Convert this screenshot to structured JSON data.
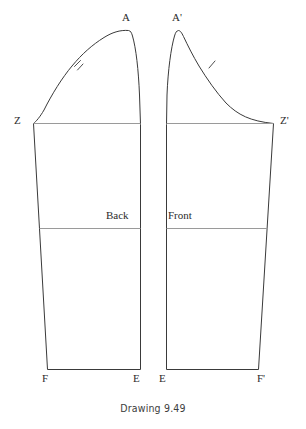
{
  "figure": {
    "caption": "Drawing 9.49",
    "background_color": "#ffffff",
    "outline_color": "#3a3a3a",
    "guide_line_color": "#9a9a9a",
    "text_color": "#2b2b2b",
    "width": 306,
    "height": 429
  },
  "pieces": [
    {
      "id": "back-sleeve",
      "name": "Back",
      "label": "Back",
      "label_x": 106,
      "label_y": 210,
      "outline_path": "M 128.5 30.5 C 120 29.8 112 32.5 104 37.5 C 92 45 82 54 72 66 C 62 78 52 94 44 110 C 40 117 36 121.5 33.5 123.5 L 47.5 369.5 L 140.5 369.5 L 140.5 124.5 L 139.5 95 C 138.5 70 136 48 132.5 36 C 131.5 32.5 130.5 30.8 128.5 30.5 Z",
      "guides": [
        {
          "name": "cap-line",
          "path": "M 33.5 123.5 L 140.5 123.5"
        },
        {
          "name": "elbow-line",
          "path": "M 39.5 228.5 L 140.5 228.5"
        }
      ],
      "notch": {
        "name": "double-notch",
        "path": "M 74.5 66.5 L 80.5 60.5 M 77.5 70.0 L 83.0 64.0"
      },
      "vertices": [
        {
          "key": "A",
          "label": "A",
          "x": 122,
          "y": 12
        },
        {
          "key": "Z",
          "label": "Z",
          "x": 14,
          "y": 115
        },
        {
          "key": "F",
          "label": "F",
          "x": 42,
          "y": 373
        },
        {
          "key": "E",
          "label": "E",
          "x": 133,
          "y": 373
        }
      ]
    },
    {
      "id": "front-sleeve",
      "name": "Front",
      "label": "Front",
      "label_x": 168,
      "label_y": 210,
      "outline_path": "M 178.5 30.5 C 180.5 30.8 181.5 32.5 183.5 36.5 C 188 46 193 56 199 66 C 207 79 216 92 226 103 C 238 115 250 121 273.5 123.5 L 258.5 369.5 L 166.5 369.5 L 166.5 124.5 L 167 95 C 168 70 171 48 174.5 36 C 175.5 32.5 176.5 30.8 178.5 30.5 Z",
      "guides": [
        {
          "name": "cap-line",
          "path": "M 166.5 123.5 L 273.5 123.5"
        },
        {
          "name": "elbow-line",
          "path": "M 166.5 228.5 L 267.5 228.5"
        }
      ],
      "notch": {
        "name": "single-notch",
        "path": "M 209.0 68.0 L 215.0 61.0"
      },
      "vertices": [
        {
          "key": "Aprime",
          "label": "A'",
          "x": 172,
          "y": 12
        },
        {
          "key": "Zprime",
          "label": "Z'",
          "x": 280,
          "y": 115
        },
        {
          "key": "E",
          "label": "E",
          "x": 159,
          "y": 373
        },
        {
          "key": "Fprime",
          "label": "F'",
          "x": 257,
          "y": 373
        }
      ]
    }
  ]
}
